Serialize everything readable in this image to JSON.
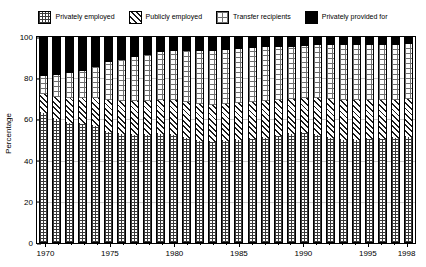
{
  "chart_data": {
    "type": "bar",
    "title": "",
    "subtitle": "",
    "xlabel": "",
    "ylabel": "Percentage",
    "ylim": [
      0,
      100
    ],
    "yticks": [
      0,
      20,
      40,
      60,
      80,
      100
    ],
    "grid": true,
    "stacked": true,
    "legend_position": "top",
    "legend": [
      {
        "name": "Privately employed",
        "pattern": "dense-grid-hatch",
        "color": "#3a3a3a"
      },
      {
        "name": "Publicly employed",
        "pattern": "diagonal-hatch",
        "color": "#1a1a1a"
      },
      {
        "name": "Transfer recipients",
        "pattern": "light-stipple",
        "color": "#6f6f6f"
      },
      {
        "name": "Privately provided for",
        "pattern": "solid",
        "color": "#000000"
      }
    ],
    "categories": [
      "1970",
      "1971",
      "1972",
      "1973",
      "1974",
      "1975",
      "1976",
      "1977",
      "1978",
      "1979",
      "1980",
      "1981",
      "1982",
      "1983",
      "1984",
      "1985",
      "1986",
      "1987",
      "1988",
      "1989",
      "1990",
      "1991",
      "1992",
      "1993",
      "1994",
      "1995",
      "1996",
      "1997",
      "1998"
    ],
    "xtick_labels": [
      "1970",
      "1975",
      "1980",
      "1985",
      "1990",
      "1995",
      "1998"
    ],
    "series": [
      {
        "name": "Privately employed",
        "values": [
          63,
          60,
          58.5,
          58,
          57,
          54,
          53,
          52.5,
          52.5,
          53,
          52.5,
          51,
          49.5,
          49,
          49.5,
          50,
          50.5,
          51,
          52,
          53,
          53.5,
          52.5,
          51,
          50,
          50,
          50.5,
          50.5,
          51,
          51.5
        ]
      },
      {
        "name": "Publicly employed",
        "values": [
          9.5,
          11,
          12,
          12.5,
          13.5,
          15.5,
          16,
          16.5,
          16.5,
          16.5,
          17,
          17.5,
          18,
          18,
          18,
          18,
          18,
          18,
          17.5,
          17,
          17,
          18,
          19,
          19.5,
          19.5,
          19,
          19,
          18.5,
          18.5
        ]
      },
      {
        "name": "Transfer recipients",
        "values": [
          8.5,
          10.5,
          12,
          13,
          15,
          18.5,
          20,
          21.5,
          22.5,
          23,
          23.5,
          24.5,
          25.5,
          26,
          26,
          26,
          26,
          26,
          25.5,
          25,
          25,
          25.5,
          26,
          26.5,
          26.5,
          26.5,
          26.5,
          26.5,
          26.5
        ]
      },
      {
        "name": "Privately provided for",
        "values": [
          19,
          18.5,
          17.5,
          16.5,
          14.5,
          12,
          11,
          9.5,
          8.5,
          7.5,
          7,
          7,
          7,
          7,
          6.5,
          6,
          5.5,
          5,
          5,
          5,
          4.5,
          4,
          4,
          4,
          4,
          4,
          4,
          4,
          3.5
        ]
      }
    ]
  }
}
